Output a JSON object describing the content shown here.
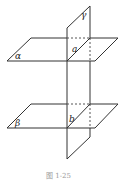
{
  "figure": {
    "caption": "图 1-25",
    "labels": {
      "plane_gamma": "γ",
      "plane_alpha": "α",
      "plane_beta": "β",
      "line_a": "a",
      "line_b": "b"
    },
    "colors": {
      "stroke": "#333333",
      "caption": "#9a9a9a"
    }
  }
}
